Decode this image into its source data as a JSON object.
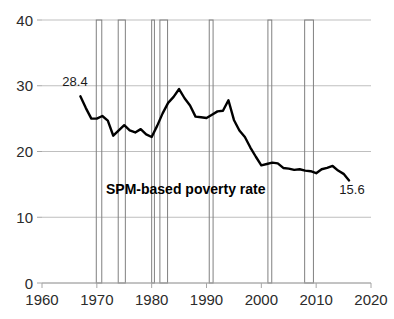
{
  "chart_data": {
    "type": "line",
    "title": "",
    "subtitle": "",
    "xlabel": "",
    "ylabel": "",
    "xlim": [
      1960,
      2020
    ],
    "ylim": [
      0,
      40
    ],
    "xticks": [
      1960,
      1970,
      1980,
      1990,
      2000,
      2010,
      2020
    ],
    "xtick_labels": [
      "1960",
      "1970",
      "1980",
      "1990",
      "2000",
      "2010",
      "2020"
    ],
    "yticks": [
      0,
      10,
      20,
      30,
      40
    ],
    "ytick_labels": [
      "0",
      "10",
      "20",
      "30",
      "40"
    ],
    "grid": "horizontal",
    "legend_position": "inline-annotation",
    "series": [
      {
        "name": "SPM-based poverty rate",
        "color": "#000000",
        "x": [
          1967,
          1968,
          1969,
          1970,
          1971,
          1972,
          1973,
          1974,
          1975,
          1976,
          1977,
          1978,
          1979,
          1980,
          1981,
          1982,
          1983,
          1984,
          1985,
          1986,
          1987,
          1988,
          1989,
          1990,
          1991,
          1992,
          1993,
          1994,
          1995,
          1996,
          1997,
          1998,
          1999,
          2000,
          2001,
          2002,
          2003,
          2004,
          2005,
          2006,
          2007,
          2008,
          2009,
          2010,
          2011,
          2012,
          2013,
          2014,
          2015,
          2016
        ],
        "values": [
          28.4,
          26.6,
          25.0,
          25.0,
          25.4,
          24.7,
          22.4,
          23.2,
          24.0,
          23.2,
          22.9,
          23.4,
          22.6,
          22.2,
          23.9,
          25.8,
          27.4,
          28.3,
          29.5,
          28.1,
          27.0,
          25.3,
          25.2,
          25.1,
          25.6,
          26.1,
          26.2,
          27.8,
          24.8,
          23.2,
          22.2,
          20.6,
          19.2,
          17.9,
          18.1,
          18.3,
          18.2,
          17.5,
          17.4,
          17.2,
          17.3,
          17.1,
          17.0,
          16.7,
          17.3,
          17.5,
          17.8,
          17.1,
          16.6,
          15.6
        ],
        "start_label": "28.4",
        "end_label": "15.6"
      }
    ],
    "recession_bands": [
      {
        "start": 1969.9,
        "end": 1970.9
      },
      {
        "start": 1973.9,
        "end": 1975.2
      },
      {
        "start": 1980.0,
        "end": 1980.5
      },
      {
        "start": 1981.5,
        "end": 1982.9
      },
      {
        "start": 1990.5,
        "end": 1991.2
      },
      {
        "start": 2001.2,
        "end": 2001.9
      },
      {
        "start": 2007.9,
        "end": 2009.5
      }
    ],
    "annotations": [
      {
        "name": "start-value-label",
        "text": "28.4",
        "x_px": 75,
        "y_px": 86
      },
      {
        "name": "end-value-label",
        "text": "15.6",
        "x_px": 352,
        "y_px": 194
      },
      {
        "name": "series-inline-label",
        "text": "SPM-based poverty rate",
        "x_px": 106,
        "y_px": 194
      }
    ],
    "colors": {
      "line": "#000000",
      "grid": "#bfbfbf",
      "axis": "#a6a6a6",
      "band_stroke": "#808080",
      "text": "#2b2b2b"
    }
  },
  "axes": {
    "x_title": "",
    "y_title": ""
  }
}
